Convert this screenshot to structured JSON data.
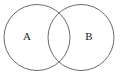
{
  "figure": {
    "type": "venn-diagram",
    "title": "",
    "background_color": "#ffffff",
    "stroke_color": "#6a6a6a",
    "stroke_width": 1,
    "label_color": "#1a1a1a",
    "width": 121,
    "height": 76
  },
  "sets": [
    {
      "id": "set-a",
      "label": "A",
      "cx": 37,
      "cy": 37.5,
      "r": 33,
      "label_x": 27,
      "label_y": 36,
      "fill": "none"
    },
    {
      "id": "set-b",
      "label": "B",
      "cx": 81,
      "cy": 37.5,
      "r": 33,
      "label_x": 89,
      "label_y": 36,
      "fill": "none"
    }
  ],
  "intersection": {
    "label": "",
    "top_crossing_x": 59,
    "top_crossing_y": 8.5,
    "bottom_crossing_x": 59,
    "bottom_crossing_y": 66.5
  }
}
